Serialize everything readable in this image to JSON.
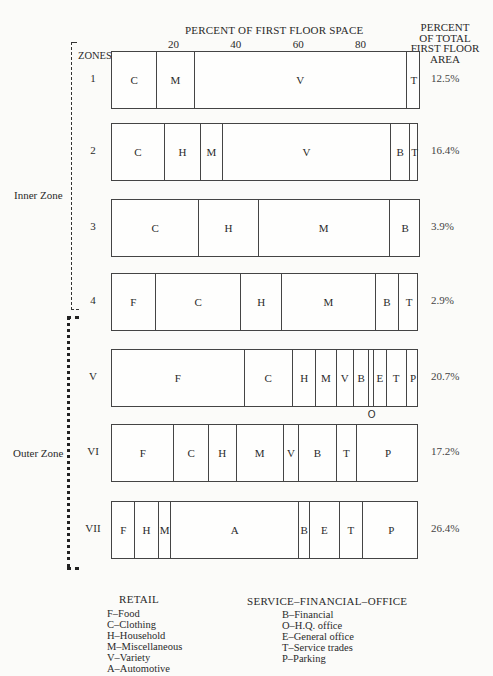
{
  "header": {
    "axis_title": "PERCENT OF FIRST FLOOR SPACE",
    "right_title_lines": [
      "PERCENT",
      "OF TOTAL",
      "FIRST FLOOR",
      "AREA"
    ],
    "zones_label": "ZONES",
    "ticks": [
      {
        "label": "20",
        "value": 20
      },
      {
        "label": "40",
        "value": 40
      },
      {
        "label": "60",
        "value": 60
      },
      {
        "label": "80",
        "value": 80
      }
    ]
  },
  "groups": {
    "inner": "Inner Zone",
    "outer": "Outer Zone"
  },
  "zones": [
    {
      "id": "1",
      "percent_total": "12.5%",
      "segments": [
        {
          "code": "C",
          "start": 0,
          "end": 14.5
        },
        {
          "code": "M",
          "start": 14.5,
          "end": 26.5
        },
        {
          "code": "V",
          "start": 26.5,
          "end": 94.5
        },
        {
          "code": "T",
          "start": 94.5,
          "end": 99
        }
      ]
    },
    {
      "id": "2",
      "percent_total": "16.4%",
      "segments": [
        {
          "code": "C",
          "start": 0,
          "end": 17
        },
        {
          "code": "H",
          "start": 17,
          "end": 28.5
        },
        {
          "code": "M",
          "start": 28.5,
          "end": 35.5
        },
        {
          "code": "V",
          "start": 35.5,
          "end": 89.5
        },
        {
          "code": "B",
          "start": 89.5,
          "end": 95.5
        },
        {
          "code": "T",
          "start": 95.5,
          "end": 98.5
        }
      ]
    },
    {
      "id": "3",
      "percent_total": "3.9%",
      "segments": [
        {
          "code": "C",
          "start": 0,
          "end": 28
        },
        {
          "code": "H",
          "start": 28,
          "end": 47
        },
        {
          "code": "M",
          "start": 47,
          "end": 89
        },
        {
          "code": "B",
          "start": 89,
          "end": 99
        }
      ]
    },
    {
      "id": "4",
      "percent_total": "2.9%",
      "segments": [
        {
          "code": "F",
          "start": 0,
          "end": 14
        },
        {
          "code": "C",
          "start": 14,
          "end": 41.5
        },
        {
          "code": "H",
          "start": 41.5,
          "end": 54.5
        },
        {
          "code": "M",
          "start": 54.5,
          "end": 84.5
        },
        {
          "code": "B",
          "start": 84.5,
          "end": 92
        },
        {
          "code": "T",
          "start": 92,
          "end": 98.5
        }
      ]
    },
    {
      "id": "V",
      "percent_total": "20.7%",
      "segments": [
        {
          "code": "F",
          "start": 0,
          "end": 42.5
        },
        {
          "code": "C",
          "start": 42.5,
          "end": 58
        },
        {
          "code": "H",
          "start": 58,
          "end": 65.5
        },
        {
          "code": "M",
          "start": 65.5,
          "end": 72
        },
        {
          "code": "V",
          "start": 72,
          "end": 77.5
        },
        {
          "code": "B",
          "start": 77.5,
          "end": 82.5
        },
        {
          "code": "",
          "start": 82.5,
          "end": 84,
          "callout": "O"
        },
        {
          "code": "E",
          "start": 84,
          "end": 88
        },
        {
          "code": "T",
          "start": 88,
          "end": 94.5
        },
        {
          "code": "P",
          "start": 94.5,
          "end": 98.5
        }
      ]
    },
    {
      "id": "VI",
      "percent_total": "17.2%",
      "segments": [
        {
          "code": "F",
          "start": 0,
          "end": 20
        },
        {
          "code": "C",
          "start": 20,
          "end": 31
        },
        {
          "code": "H",
          "start": 31,
          "end": 40
        },
        {
          "code": "M",
          "start": 40,
          "end": 55
        },
        {
          "code": "V",
          "start": 55,
          "end": 60
        },
        {
          "code": "B",
          "start": 60,
          "end": 72
        },
        {
          "code": "T",
          "start": 72,
          "end": 78.5
        },
        {
          "code": "P",
          "start": 78.5,
          "end": 98.5
        }
      ]
    },
    {
      "id": "VII",
      "percent_total": "26.4%",
      "segments": [
        {
          "code": "F",
          "start": 0,
          "end": 7.5
        },
        {
          "code": "H",
          "start": 7.5,
          "end": 15
        },
        {
          "code": "M",
          "start": 15,
          "end": 19
        },
        {
          "code": "A",
          "start": 19,
          "end": 60
        },
        {
          "code": "B",
          "start": 60,
          "end": 63.5
        },
        {
          "code": "E",
          "start": 63.5,
          "end": 73
        },
        {
          "code": "T",
          "start": 73,
          "end": 80.5
        },
        {
          "code": "P",
          "start": 80.5,
          "end": 98.5
        }
      ]
    }
  ],
  "legend": {
    "retail": {
      "title": "RETAIL",
      "items": [
        "F–Food",
        "C–Clothing",
        "H–Household",
        "M–Miscellaneous",
        "V–Variety",
        "A–Automotive"
      ]
    },
    "service": {
      "title": "SERVICE–FINANCIAL–OFFICE",
      "items": [
        "B–Financial",
        "O–H.Q. office",
        "E–General office",
        "T–Service trades",
        "P–Parking"
      ]
    }
  },
  "colors": {
    "ink": "#2a2a2a",
    "paper": "#fbfbf9",
    "rule": "#444444"
  }
}
